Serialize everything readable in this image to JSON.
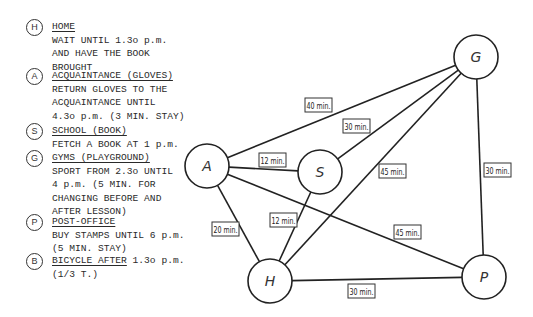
{
  "legend": {
    "items": [
      {
        "key": "H",
        "title": "HOME",
        "suffix": "",
        "lines": [
          "WAIT UNTIL 1.3o p.m.",
          "AND HAVE THE BOOK",
          "BROUGHT"
        ],
        "y": 27
      },
      {
        "key": "A",
        "title": "ACQUAINTANCE (GLOVES)",
        "suffix": "",
        "lines": [
          "RETURN GLOVES TO THE",
          "ACQUAINTANCE UNTIL",
          "4.3o p.m. (3 MIN. STAY)"
        ],
        "y": 76
      },
      {
        "key": "S",
        "title": "SCHOOL (BOOK)",
        "suffix": "",
        "lines": [
          "FETCH A BOOK AT 1 p.m."
        ],
        "y": 131
      },
      {
        "key": "G",
        "title": "GYMS (PLAYGROUND)",
        "suffix": "",
        "lines": [
          "SPORT FROM 2.3o UNTIL",
          "4 p.m. (5 MIN. FOR",
          "CHANGING BEFORE AND",
          "AFTER LESSON)"
        ],
        "y": 158
      },
      {
        "key": "P",
        "title": "POST-OFFICE",
        "suffix": "",
        "lines": [
          "BUY STAMPS UNTIL 6 p.m.",
          "(5 MIN. STAY)"
        ],
        "y": 222
      },
      {
        "key": "B",
        "title": "BICYCLE AFTER",
        "suffix": " 1.3o p.m.",
        "lines": [
          "(1/3 T.)"
        ],
        "y": 261
      }
    ]
  },
  "graph": {
    "nodes": [
      {
        "id": "A",
        "label": "A",
        "x": 207,
        "y": 166,
        "r": 22
      },
      {
        "id": "S",
        "label": "S",
        "x": 320,
        "y": 172,
        "r": 22
      },
      {
        "id": "G",
        "label": "G",
        "x": 476,
        "y": 57,
        "r": 22
      },
      {
        "id": "H",
        "label": "H",
        "x": 270,
        "y": 281,
        "r": 22
      },
      {
        "id": "P",
        "label": "P",
        "x": 484,
        "y": 277,
        "r": 22
      }
    ],
    "edges": [
      {
        "from": "A",
        "to": "G",
        "label": "40 min.",
        "lx": 305,
        "ly": 98
      },
      {
        "from": "S",
        "to": "G",
        "label": "30 min.",
        "lx": 343,
        "ly": 119
      },
      {
        "from": "A",
        "to": "S",
        "label": "12 min.",
        "lx": 259,
        "ly": 153
      },
      {
        "from": "H",
        "to": "G",
        "label": "45 min.",
        "lx": 379,
        "ly": 164
      },
      {
        "from": "G",
        "to": "P",
        "label": "30 min.",
        "lx": 484,
        "ly": 163
      },
      {
        "from": "A",
        "to": "H",
        "label": "20 min.",
        "lx": 212,
        "ly": 222
      },
      {
        "from": "S",
        "to": "H",
        "label": "12 min.",
        "lx": 270,
        "ly": 213
      },
      {
        "from": "A",
        "to": "P",
        "label": "45 min.",
        "lx": 394,
        "ly": 225
      },
      {
        "from": "H",
        "to": "P",
        "label": "30 min.",
        "lx": 348,
        "ly": 284
      }
    ]
  }
}
